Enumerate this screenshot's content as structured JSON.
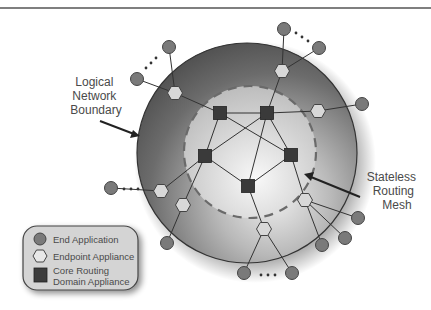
{
  "diagram": {
    "labels": {
      "boundary": [
        "Logical",
        "Network",
        "Boundary"
      ],
      "mesh": [
        "Stateless",
        "Routing",
        "Mesh"
      ]
    },
    "legend": {
      "items": [
        {
          "shape": "circle",
          "label": "End Application"
        },
        {
          "shape": "hexagon",
          "label": "Endpoint Appliance"
        },
        {
          "shape": "square",
          "label": "Core Routing",
          "label2": "Domain Appliance"
        }
      ]
    },
    "colors": {
      "end_application": "#7a7a7a",
      "endpoint_appliance": "#d8d8d8",
      "core_routing": "#3a3a3a",
      "outer_ring": "#5c5c5c",
      "inner_zone": "#c8c8c8",
      "dashed_boundary": "#666666"
    },
    "nodes": {
      "core_routing": [
        "core-1",
        "core-2",
        "core-3",
        "core-4",
        "core-5"
      ],
      "endpoint_appliance": [
        "ep-1",
        "ep-2",
        "ep-3",
        "ep-4",
        "ep-5",
        "ep-6",
        "ep-7"
      ],
      "end_application": [
        "app-1",
        "app-2",
        "app-3",
        "app-4",
        "app-5",
        "app-6",
        "app-7",
        "app-8",
        "app-9",
        "app-10",
        "app-11",
        "app-12"
      ]
    },
    "edges": [
      [
        "core-1",
        "core-2"
      ],
      [
        "core-1",
        "core-3"
      ],
      [
        "core-1",
        "core-4"
      ],
      [
        "core-2",
        "core-3"
      ],
      [
        "core-2",
        "core-4"
      ],
      [
        "core-2",
        "core-5"
      ],
      [
        "core-3",
        "core-5"
      ],
      [
        "core-4",
        "core-5"
      ],
      [
        "core-1",
        "ep-1"
      ],
      [
        "core-2",
        "ep-2"
      ],
      [
        "core-2",
        "ep-3"
      ],
      [
        "core-3",
        "ep-4"
      ],
      [
        "core-3",
        "ep-5"
      ],
      [
        "core-5",
        "ep-6"
      ],
      [
        "core-4",
        "ep-7"
      ],
      [
        "ep-1",
        "app-1"
      ],
      [
        "ep-1",
        "app-2"
      ],
      [
        "ep-2",
        "app-3"
      ],
      [
        "ep-2",
        "app-4"
      ],
      [
        "ep-3",
        "app-5"
      ],
      [
        "ep-4",
        "app-6"
      ],
      [
        "ep-5",
        "app-7"
      ],
      [
        "ep-6",
        "app-11"
      ],
      [
        "ep-6",
        "app-12"
      ],
      [
        "ep-7",
        "app-8"
      ],
      [
        "ep-7",
        "app-9"
      ],
      [
        "ep-7",
        "app-10"
      ]
    ]
  }
}
